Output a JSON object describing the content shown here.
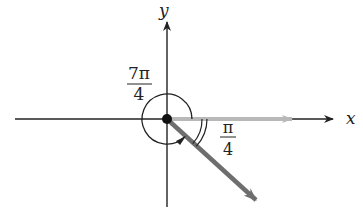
{
  "diagram": {
    "type": "angle-in-standard-position",
    "axes": {
      "x_label": "x",
      "y_label": "y"
    },
    "angles": [
      {
        "name": "positive-angle",
        "label_num": "7π",
        "label_den": "4",
        "direction": "counterclockwise",
        "description": "full rotation arc minus π/4"
      },
      {
        "name": "reference-angle",
        "label_num": "π",
        "label_den": "4",
        "direction": "clockwise",
        "description": "double arc between positive x-axis and terminal side"
      }
    ],
    "rays": [
      {
        "name": "initial-side",
        "color": "#b8b8b8",
        "direction_deg": 0
      },
      {
        "name": "terminal-side",
        "color": "#6e6e6e",
        "direction_deg": -45
      }
    ],
    "colors": {
      "axis": "#222222",
      "initial_ray": "#b8b8b8",
      "terminal_ray": "#6e6e6e",
      "arc": "#222222"
    }
  }
}
